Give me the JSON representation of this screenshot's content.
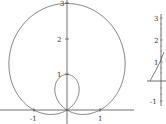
{
  "chart_data": [
    {
      "type": "line",
      "title": "",
      "description": "Polar curve r = 1 + 2 sin(theta) (limacon with inner loop)",
      "equation": "r = 1 + 2 sin(theta)",
      "xlabel": "",
      "ylabel": "",
      "xticks": [
        "-1",
        "1"
      ],
      "yticks": [
        "1",
        "2",
        "3"
      ],
      "xlim": [
        -1.9,
        2.0
      ],
      "ylim": [
        -0.3,
        3.0
      ],
      "grid": false,
      "legend": null
    },
    {
      "type": "line",
      "title": "",
      "description": "Partial second plot (cropped at right edge)",
      "xlabel": "",
      "ylabel": "",
      "yticks": [
        "3",
        "2",
        "1",
        "-1"
      ],
      "grid": false,
      "legend": null
    }
  ],
  "plot1": {
    "xticks": [
      {
        "label": "-1"
      },
      {
        "label": "1"
      }
    ],
    "yticks": [
      {
        "label": "1"
      },
      {
        "label": "2"
      },
      {
        "label": "3"
      }
    ]
  },
  "plot2": {
    "yticks": [
      {
        "label": "3"
      },
      {
        "label": "2"
      },
      {
        "label": "1"
      },
      {
        "label": "-1"
      }
    ]
  }
}
